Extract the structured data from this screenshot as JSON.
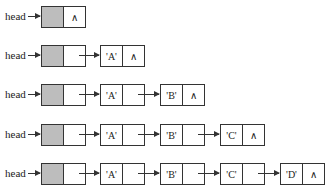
{
  "diagram": {
    "type": "singly-linked-list-with-head-node",
    "head_label": "head",
    "null_symbol": "∧",
    "rows": [
      {
        "values": []
      },
      {
        "values": [
          "'A'"
        ]
      },
      {
        "values": [
          "'A'",
          "'B'"
        ]
      },
      {
        "values": [
          "'A'",
          "'B'",
          "'C'"
        ]
      },
      {
        "values": [
          "'A'",
          "'B'",
          "'C'",
          "'D'"
        ]
      }
    ]
  }
}
